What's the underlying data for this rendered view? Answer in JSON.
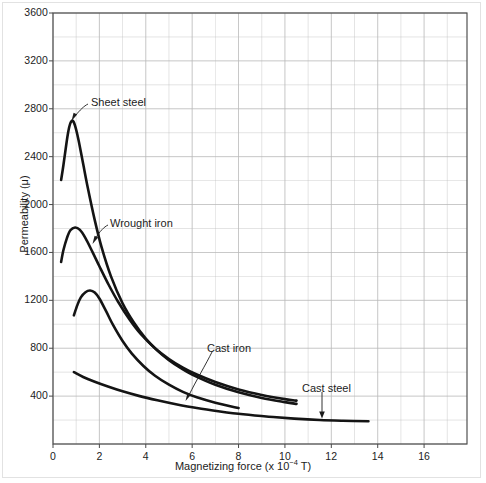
{
  "chart_data": {
    "type": "line",
    "title": "",
    "xlabel": "Magnetizing force (x 10−4 T)",
    "ylabel": "Permeability (μ)",
    "xlim": [
      0,
      17.85
    ],
    "ylim": [
      0,
      3600
    ],
    "grid": true,
    "x_major_ticks": [
      0,
      2,
      4,
      6,
      8,
      10,
      12,
      14,
      16
    ],
    "x_minor_step": 1,
    "y_major_ticks": [
      0,
      400,
      800,
      1200,
      1600,
      2000,
      2400,
      2800,
      3200,
      3600
    ],
    "y_minor_step": 200,
    "legend_position": "inline-annotations",
    "line_color": "#141414",
    "grid_color": "#b9b9b9",
    "axis_color": "#4a4a4a",
    "series": [
      {
        "name": "Sheet steel",
        "points": [
          [
            0.35,
            2205
          ],
          [
            0.45,
            2330
          ],
          [
            0.55,
            2470
          ],
          [
            0.65,
            2600
          ],
          [
            0.75,
            2680
          ],
          [
            0.85,
            2700
          ],
          [
            0.95,
            2660
          ],
          [
            1.1,
            2540
          ],
          [
            1.3,
            2340
          ],
          [
            1.5,
            2140
          ],
          [
            1.8,
            1870
          ],
          [
            2.1,
            1640
          ],
          [
            2.5,
            1400
          ],
          [
            3.0,
            1175
          ],
          [
            3.5,
            1010
          ],
          [
            4.0,
            880
          ],
          [
            4.5,
            780
          ],
          [
            5.0,
            700
          ],
          [
            5.5,
            635
          ],
          [
            6.0,
            580
          ],
          [
            7.0,
            495
          ],
          [
            8.0,
            432
          ],
          [
            9.0,
            385
          ],
          [
            10.0,
            350
          ],
          [
            10.5,
            335
          ]
        ]
      },
      {
        "name": "Wrought iron",
        "points": [
          [
            0.35,
            1520
          ],
          [
            0.45,
            1620
          ],
          [
            0.6,
            1720
          ],
          [
            0.75,
            1785
          ],
          [
            0.95,
            1808
          ],
          [
            1.15,
            1790
          ],
          [
            1.4,
            1720
          ],
          [
            1.7,
            1605
          ],
          [
            2.0,
            1485
          ],
          [
            2.4,
            1330
          ],
          [
            2.8,
            1190
          ],
          [
            3.3,
            1040
          ],
          [
            3.8,
            915
          ],
          [
            4.4,
            800
          ],
          [
            5.0,
            710
          ],
          [
            5.6,
            638
          ],
          [
            6.2,
            580
          ],
          [
            7.0,
            518
          ],
          [
            8.0,
            456
          ],
          [
            9.0,
            410
          ],
          [
            10.0,
            375
          ],
          [
            10.5,
            362
          ]
        ]
      },
      {
        "name": "Cast iron",
        "points": [
          [
            0.9,
            1075
          ],
          [
            1.05,
            1160
          ],
          [
            1.2,
            1225
          ],
          [
            1.4,
            1268
          ],
          [
            1.6,
            1282
          ],
          [
            1.8,
            1265
          ],
          [
            2.0,
            1215
          ],
          [
            2.3,
            1105
          ],
          [
            2.6,
            990
          ],
          [
            3.0,
            860
          ],
          [
            3.4,
            755
          ],
          [
            3.9,
            652
          ],
          [
            4.4,
            570
          ],
          [
            5.0,
            495
          ],
          [
            5.6,
            435
          ],
          [
            6.2,
            390
          ],
          [
            7.0,
            345
          ],
          [
            8.0,
            300
          ]
        ]
      },
      {
        "name": "Cast steel",
        "points": [
          [
            0.9,
            600
          ],
          [
            1.3,
            560
          ],
          [
            1.8,
            520
          ],
          [
            2.4,
            478
          ],
          [
            3.0,
            440
          ],
          [
            3.7,
            402
          ],
          [
            4.5,
            365
          ],
          [
            5.3,
            332
          ],
          [
            6.2,
            300
          ],
          [
            7.2,
            272
          ],
          [
            8.2,
            248
          ],
          [
            9.3,
            228
          ],
          [
            10.4,
            212
          ],
          [
            11.5,
            200
          ],
          [
            12.5,
            194
          ],
          [
            13.6,
            190
          ]
        ]
      }
    ],
    "annotations": [
      {
        "label": "Sheet steel",
        "label_x": 91,
        "label_y": 96,
        "leader": "M 88 104 C 84 106, 80 110, 75 116",
        "arrow_at": [
          73,
          118
        ],
        "arrow_dir": "down-left"
      },
      {
        "label": "Wrought iron",
        "label_x": 110,
        "label_y": 217,
        "leader": "M 108 225 C 104 227, 100 231, 95 239",
        "arrow_at": [
          94,
          241
        ],
        "arrow_dir": "down-left"
      },
      {
        "label": "Cast iron",
        "label_x": 207,
        "label_y": 342,
        "leader": "M 212 352 C 206 364, 196 381, 189 395",
        "arrow_at": [
          187,
          398
        ],
        "arrow_dir": "down-left"
      },
      {
        "label": "Cast steel",
        "label_x": 302,
        "label_y": 382,
        "leader": "M 322 392 L 322 412",
        "arrow_at": [
          322,
          415
        ],
        "arrow_dir": "down"
      }
    ]
  },
  "axis_labels": {
    "y_text": "Permeability (μ)",
    "x_text_pre": "Magnetizing force (x 10",
    "x_text_sup": "−4",
    "x_text_post": " T)"
  },
  "y_ticks": [
    {
      "value": "3600"
    },
    {
      "value": "3200"
    },
    {
      "value": "2800"
    },
    {
      "value": "2400"
    },
    {
      "value": "2000"
    },
    {
      "value": "1600"
    },
    {
      "value": "1200"
    },
    {
      "value": "800"
    },
    {
      "value": "400"
    }
  ],
  "x_ticks": [
    {
      "value": "0"
    },
    {
      "value": "2"
    },
    {
      "value": "4"
    },
    {
      "value": "6"
    },
    {
      "value": "8"
    },
    {
      "value": "10"
    },
    {
      "value": "12"
    },
    {
      "value": "14"
    },
    {
      "value": "16"
    }
  ],
  "annotation_labels": [
    {
      "text": "Sheet steel"
    },
    {
      "text": "Wrought iron"
    },
    {
      "text": "Cast iron"
    },
    {
      "text": "Cast steel"
    }
  ]
}
